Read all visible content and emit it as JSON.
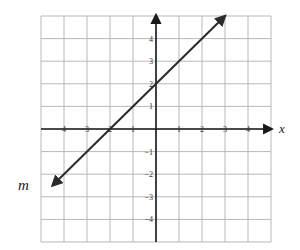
{
  "chart_data": {
    "type": "line",
    "title": "",
    "xlabel": "x",
    "ylabel": "",
    "xlim": [
      -5,
      5
    ],
    "ylim": [
      -5,
      5
    ],
    "grid": true,
    "x_ticks": [
      -4,
      -3,
      -2,
      -1,
      1,
      2,
      3,
      4
    ],
    "x_tick_labels": [
      "4",
      "3",
      "2",
      "1",
      "1",
      "2",
      "3",
      "4"
    ],
    "y_ticks": [
      4,
      3,
      2,
      1,
      -1,
      -2,
      -3,
      -4
    ],
    "y_tick_labels": [
      "4",
      "3",
      "2",
      "1",
      "−1",
      "−2",
      "−3",
      "−4"
    ],
    "series": [
      {
        "name": "m",
        "equation": "y = x + 2",
        "slope": 1,
        "y_intercept": 2,
        "x_intercept": -2,
        "points": [
          {
            "x": -4.5,
            "y": -2.5
          },
          {
            "x": -2,
            "y": 0
          },
          {
            "x": 0,
            "y": 2
          },
          {
            "x": 3,
            "y": 5
          }
        ],
        "arrows": "both"
      }
    ],
    "legend": "none"
  },
  "labels": {
    "x_axis": "x",
    "line": "m"
  },
  "colors": {
    "grid": "#b8b8b8",
    "axis": "#1a1a1a",
    "line": "#2a2a2a",
    "background": "#ffffff"
  }
}
